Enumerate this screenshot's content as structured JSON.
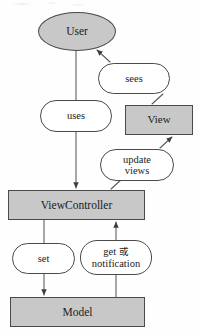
{
  "diagram": {
    "type": "flow-diagram",
    "colors": {
      "node_fill_gray": "#c8c8c8",
      "node_fill_white": "#ffffff",
      "stroke": "#4a4a4a",
      "text": "#1b1b1b",
      "background": "#fefefe"
    },
    "nodes": [
      {
        "id": "user",
        "label": "User",
        "shape": "ellipse",
        "fill": "#c8c8c8"
      },
      {
        "id": "sees",
        "label": "sees",
        "shape": "stadium",
        "fill": "#ffffff"
      },
      {
        "id": "uses",
        "label": "uses",
        "shape": "stadium",
        "fill": "#ffffff"
      },
      {
        "id": "view",
        "label": "View",
        "shape": "rect",
        "fill": "#c8c8c8"
      },
      {
        "id": "update",
        "label_line1": "update",
        "label_line2": "views",
        "shape": "stadium",
        "fill": "#ffffff"
      },
      {
        "id": "viewctrl",
        "label": "ViewController",
        "shape": "rect",
        "fill": "#c8c8c8"
      },
      {
        "id": "set",
        "label": "set",
        "shape": "stadium",
        "fill": "#ffffff"
      },
      {
        "id": "get",
        "label_line1_pre": "get ",
        "label_line1_cjk": "或",
        "label_line2": "notification",
        "shape": "stadium",
        "fill": "#ffffff"
      },
      {
        "id": "model",
        "label": "Model",
        "shape": "rect",
        "fill": "#c8c8c8"
      }
    ],
    "edges": [
      {
        "from": "user",
        "to": "uses",
        "arrow": "none"
      },
      {
        "from": "uses",
        "to": "viewctrl",
        "arrow": "down"
      },
      {
        "from": "viewctrl",
        "to": "update",
        "arrow": "none"
      },
      {
        "from": "update",
        "to": "view",
        "arrow": "up-right"
      },
      {
        "from": "view",
        "to": "sees",
        "arrow": "none"
      },
      {
        "from": "sees",
        "to": "user",
        "arrow": "up-left"
      },
      {
        "from": "viewctrl",
        "to": "set",
        "arrow": "none"
      },
      {
        "from": "set",
        "to": "model",
        "arrow": "down"
      },
      {
        "from": "model",
        "to": "get",
        "arrow": "none"
      },
      {
        "from": "get",
        "to": "viewctrl",
        "arrow": "up"
      }
    ]
  }
}
